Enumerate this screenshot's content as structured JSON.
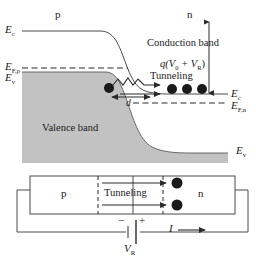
{
  "figure": {
    "type": "band-diagram-with-circuit"
  },
  "band_diagram": {
    "region_labels": {
      "p_side": "p",
      "n_side": "n"
    },
    "energy_levels": {
      "Ec_left": "E",
      "Ec_left_sub": "c",
      "EFp": "E",
      "EFp_sub": "F,p",
      "Ev_left": "E",
      "Ev_left_sub": "v",
      "Ec_right": "E",
      "Ec_right_sub": "c",
      "EFn_right": "E",
      "EFn_right_sub": "F,n",
      "Ev_right": "E",
      "Ev_right_sub": "v"
    },
    "annotations": {
      "conduction_band": "Conduction band",
      "valence_band": "Valence band",
      "tunneling": "Tunneling",
      "barrier_width": "d",
      "band_bending_q": "q",
      "band_bending_expr": "(V",
      "band_bending_sub0": "0",
      "band_bending_plus": " + V",
      "band_bending_subR": "R",
      "band_bending_close": ")"
    },
    "electron_dots_n_side": 3,
    "electron_dot_p_side": 1,
    "colors": {
      "valence_fill": "#c2c2c2",
      "line": "#3a3a3a",
      "text": "#1a1a1a"
    }
  },
  "circuit_diagram": {
    "device_labels": {
      "p_region": "p",
      "n_region": "n",
      "tunneling": "Tunneling"
    },
    "electron_dots": 2,
    "battery": {
      "negative_terminal": "−",
      "positive_terminal": "+",
      "label": "V",
      "label_sub": "R"
    },
    "current": {
      "symbol": "I",
      "arrow": "→"
    }
  }
}
